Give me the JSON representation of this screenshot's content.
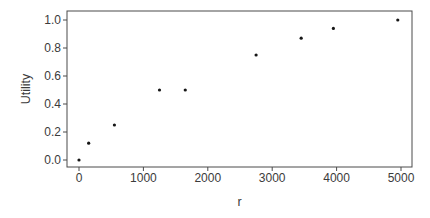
{
  "chart_data": {
    "type": "scatter",
    "title": "",
    "xlabel": "r",
    "ylabel": "Utility",
    "x": [
      0,
      150,
      550,
      1250,
      1650,
      2750,
      3450,
      3950,
      4950
    ],
    "y": [
      0.0,
      0.12,
      0.25,
      0.5,
      0.5,
      0.75,
      0.87,
      0.94,
      1.0
    ],
    "xlim": [
      0,
      5000
    ],
    "ylim": [
      0.0,
      1.0
    ],
    "x_ticks": {
      "values": [
        0,
        1000,
        2000,
        3000,
        4000,
        5000
      ],
      "labels": [
        "0",
        "1000",
        "2000",
        "3000",
        "4000",
        "5000"
      ]
    },
    "y_ticks": {
      "values": [
        0.0,
        0.2,
        0.4,
        0.6,
        0.8,
        1.0
      ],
      "labels": [
        "0.0",
        "0.2",
        "0.4",
        "0.6",
        "0.8",
        "1.0"
      ]
    },
    "grid": false,
    "legend": null,
    "marker": {
      "shape": "dot",
      "size_px": 3.2,
      "color": "#161616"
    },
    "colors": {
      "frame": "#4a4a4a",
      "tick": "#4a4a4a",
      "text": "#3b3b3b",
      "background": "#ffffff"
    }
  }
}
